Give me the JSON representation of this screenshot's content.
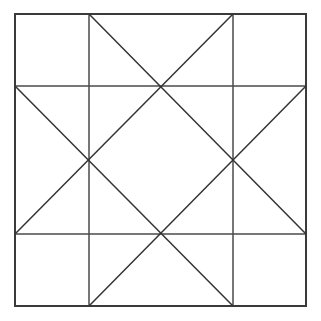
{
  "figure": {
    "background_color": "#ffffff",
    "line_color": "#3a3a3a",
    "canvas": {
      "width": 321,
      "height": 321
    },
    "outer_square": {
      "label": "outer-square",
      "x": 15,
      "y": 14,
      "width": 291,
      "height": 292,
      "stroke_width": 2
    },
    "grid": {
      "label": "three-by-three-grid",
      "vertical_x": [
        89,
        233
      ],
      "horizontal_y": [
        86,
        234
      ],
      "stroke_width": 1.5
    },
    "edge_nodes": {
      "top_left_v": [
        89,
        14
      ],
      "top_right_v": [
        233,
        14
      ],
      "left_top_h": [
        15,
        86
      ],
      "right_top_h": [
        306,
        86
      ],
      "left_bottom_h": [
        15,
        234
      ],
      "right_bottom_h": [
        306,
        234
      ],
      "bottom_left_v": [
        89,
        306
      ],
      "bottom_right_v": [
        233,
        306
      ]
    },
    "star_points": {
      "top": [
        160,
        86
      ],
      "left": [
        89,
        160
      ],
      "right": [
        233,
        160
      ],
      "bottom": [
        160,
        234
      ]
    },
    "center": [
      160,
      160
    ],
    "diagonals": [
      {
        "name": "top-left-v-to-right-top-h",
        "x1": 89,
        "y1": 14,
        "x2": 306,
        "y2": 234
      },
      {
        "name": "top-right-v-to-left-top-h",
        "x1": 233,
        "y1": 14,
        "x2": 15,
        "y2": 234
      },
      {
        "name": "left-top-h-to-bottom-right-v",
        "x1": 15,
        "y1": 86,
        "x2": 233,
        "y2": 306
      },
      {
        "name": "right-top-h-to-bottom-left-v",
        "x1": 306,
        "y1": 86,
        "x2": 89,
        "y2": 306
      }
    ],
    "counts": {
      "outer_square_count": 1,
      "grid_line_count": 4,
      "diagonal_count": 4,
      "star_point_count": 4
    }
  },
  "chart_data": {
    "type": "diagram",
    "shape": "square-with-inscribed-star"
  }
}
